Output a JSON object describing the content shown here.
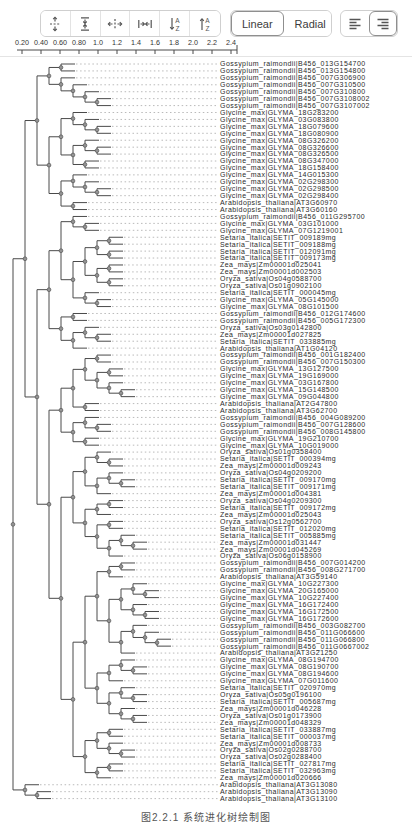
{
  "toolbar": {
    "icon_buttons": [
      {
        "icon": "expand-vertical-icon"
      },
      {
        "icon": "compress-vertical-icon"
      },
      {
        "icon": "expand-horizontal-icon"
      },
      {
        "icon": "compress-horizontal-icon"
      },
      {
        "icon": "sort-descending-icon"
      },
      {
        "icon": "sort-ascending-icon"
      }
    ],
    "layout_buttons": [
      {
        "label": "Linear",
        "selected": true
      },
      {
        "label": "Radial",
        "selected": false
      }
    ],
    "align_buttons": [
      {
        "icon": "align-left-icon",
        "selected": false
      },
      {
        "icon": "align-right-icon",
        "selected": true
      }
    ]
  },
  "scale_bar": {
    "ticks": [
      "0.20",
      "0.40",
      "0.60",
      "0.80",
      "1.0",
      "1.2",
      "1.4",
      "1.6",
      "1.8",
      "2.0",
      "2.2",
      "2.4"
    ]
  },
  "caption": {
    "text": "图2.2.1 系统进化树绘制图"
  },
  "colors": {
    "branch": "#4a4a4a",
    "leader": "#a8a8a8",
    "node_fill": "#949494",
    "node_stroke": "#4a4a4a",
    "label": "#2b2b2b",
    "tick_label": "#333333"
  },
  "tree": {
    "leaves": [
      "Gossypium_raimondii|B456_013G154700",
      "Gossypium_raimondii|B456_013G154800",
      "Gossypium_raimondii|B456_007G306900",
      "Gossypium_raimondii|B456_007G310500",
      "Gossypium_raimondii|B456_007G310800",
      "Gossypium_raimondii|B456_007G3108002",
      "Gossypium_raimondii|B456_007G3107002",
      "Glycine_max|GLYMA_18G283200",
      "Glycine_max|GLYMA_03G083800",
      "Glycine_max|GLYMA_18G079600",
      "Glycine_max|GLYMA_18G080900",
      "Glycine_max|GLYMA_08G326200",
      "Glycine_max|GLYMA_08G326600",
      "Glycine_max|GLYMA_08G326500",
      "Glycine_max|GLYMA_08G347000",
      "Glycine_max|GLYMA_18G158400",
      "Glycine_max|GLYMA_14G015300",
      "Glycine_max|GLYMA_02G298300",
      "Glycine_max|GLYMA_02G298500",
      "Glycine_max|GLYMA_02G298400",
      "Arabidopsis_thaliana|AT3G60970",
      "Arabidopsis_thaliana|AT3G60160",
      "Gossypium_raimondii|B456_011G295700",
      "Glycine_max|GLYMA_03G101000",
      "Glycine_max|GLYMA_07G1219001",
      "Setaria_italica|SETIT_009189mg",
      "Setaria_italica|SETIT_009188mg",
      "Setaria_italica|SETIT_012091mg",
      "Setaria_italica|SETIT_009173mg",
      "Zea_mays|Zm00001d025041",
      "Zea_mays|Zm00001d002503",
      "Oryza_sativa|Os04g0588700",
      "Oryza_sativa|Os01g0902100",
      "Setaria_italica|SETIT_000045mg",
      "Glycine_max|GLYMA_05G145000",
      "Glycine_max|GLYMA_08G101500",
      "Gossypium_raimondii|B456_012G174600",
      "Gossypium_raimondii|B456_005G172300",
      "Oryza_sativa|Os03g0142800",
      "Zea_mays|Zm00001d027825",
      "Setaria_italica|SETIT_033885mg",
      "Arabidopsis_thaliana|AT1G04120",
      "Gossypium_raimondii|B456_001G182400",
      "Gossypium_raimondii|B456_007G150300",
      "Glycine_max|GLYMA_13G127500",
      "Glycine_max|GLYMA_19G169000",
      "Glycine_max|GLYMA_03G167800",
      "Glycine_max|GLYMA_15G148500",
      "Glycine_max|GLYMA_09G044800",
      "Arabidopsis_thaliana|AT2G47800",
      "Arabidopsis_thaliana|AT3G62700",
      "Gossypium_raimondii|B456_004G089200",
      "Gossypium_raimondii|B456_007G128600",
      "Gossypium_raimondii|B456_008G145800",
      "Glycine_max|GLYMA_19G210700",
      "Glycine_max|GLYMA_10G019000",
      "Oryza_sativa|Os01g0358400",
      "Setaria_italica|SETIT_000394mg",
      "Zea_mays|Zm00001d009243",
      "Oryza_sativa|Os04g0209200",
      "Setaria_italica|SETIT_009170mg",
      "Setaria_italica|SETIT_009171mg",
      "Zea_mays|Zm00001d004381",
      "Oryza_sativa|Os04g0209300",
      "Setaria_italica|SETIT_009172mg",
      "Zea_mays|Zm00001d025043",
      "Oryza_sativa|Os12g0562700",
      "Setaria_italica|SETIT_012020mg",
      "Setaria_italica|SETIT_005885mg",
      "Zea_mays|Zm00001d031447",
      "Zea_mays|Zm00001d045269",
      "Oryza_sativa|Os06g0158900",
      "Gossypium_raimondii|B456_007G014200",
      "Gossypium_raimondii|B456_008G271700",
      "Arabidopsis_thaliana|AT3G59140",
      "Glycine_max|GLYMA_10G227300",
      "Glycine_max|GLYMA_20G165000",
      "Glycine_max|GLYMA_10G227400",
      "Glycine_max|GLYMA_16G172400",
      "Glycine_max|GLYMA_16G172500",
      "Glycine_max|GLYMA_16G172600",
      "Gossypium_raimondii|B456_003G082700",
      "Gossypium_raimondii|B456_011G066600",
      "Gossypium_raimondii|B456_011G066800",
      "Gossypium_raimondii|B456_011G0667002",
      "Arabidopsis_thaliana|AT3G21250",
      "Glycine_max|GLYMA_08G194700",
      "Glycine_max|GLYMA_08G190700",
      "Glycine_max|GLYMA_08G194600",
      "Glycine_max|GLYMA_07G011600",
      "Setaria_italica|SETIT_020970mg",
      "Oryza_sativa|Os05g0196100",
      "Setaria_italica|SETIT_005687mg",
      "Zea_mays|Zm00001d046228",
      "Oryza_sativa|Os01g0173900",
      "Zea_mays|Zm00001d048329",
      "Setaria_italica|SETIT_033887mg",
      "Setaria_italica|SETIT_000037mg",
      "Zea_mays|Zm00001d008733",
      "Oryza_sativa|Os02g0288700",
      "Oryza_sativa|Os02g0288400",
      "Setaria_italica|SETIT_027817mg",
      "Setaria_italica|SETIT_032963mg",
      "Zea_mays|Zm00001d020666",
      "Arabidopsis_thaliana|AT3G13080",
      "Arabidopsis_thaliana|AT3G13090",
      "Arabidopsis_thaliana|AT3G13100"
    ],
    "topology": [
      [
        [
          [
            [
              0,
              1
            ],
            [
              2,
              [
                3,
                [
                  4,
                  [
                    5,
                    6
                  ]
                ]
              ]
            ]
          ],
          [
            [
              [
                7,
                [
                  8,
                  [
                    9,
                    10
                  ]
                ]
              ],
              [
                [
                  11,
                  [
                    12,
                    13
                  ]
                ],
                [
                  14,
                  15
                ]
              ]
            ],
            [
              [
                16,
                [
                  17,
                  [
                    18,
                    19
                  ]
                ]
              ],
              [
                20,
                21
              ]
            ]
          ]
        ],
        [
          [
            [
              [
                22,
                [
                  23,
                  24
                ]
              ],
              [
                [
                  [
                    [
                      25,
                      26
                    ],
                    [
                      27,
                      28
                    ]
                  ],
                  [
                    [
                      29,
                      30
                    ],
                    [
                      31,
                      32
                    ]
                  ]
                ],
                [
                  33,
                  [
                    34,
                    35
                  ]
                ]
              ]
            ],
            [
              [
                36,
                37
              ],
              [
                [
                  38,
                  [
                    39,
                    40
                  ]
                ],
                41
              ]
            ]
          ],
          [
            [
              [
                [
                  [
                    42,
                    43
                  ],
                  [
                    [
                      44,
                      45
                    ],
                    [
                      46,
                      [
                        47,
                        48
                      ]
                    ]
                  ]
                ],
                [
                  49,
                  50
                ]
              ],
              [
                [
                  51,
                  [
                    52,
                    53
                  ]
                ],
                [
                  54,
                  55
                ]
              ]
            ],
            [
              [
                [
                  [
                    56,
                    [
                      57,
                      58
                    ]
                  ],
                  [
                    [
                      59,
                      [
                        60,
                        61
                      ]
                    ],
                    62
                  ]
                ],
                [
                  [
                    [
                      63,
                      64
                    ],
                    65
                  ],
                  [
                    [
                      66,
                      67
                    ],
                    [
                      [
                        68,
                        [
                          69,
                          70
                        ]
                      ],
                      71
                    ]
                  ]
                ]
              ],
              [
                [
                  [
                    [
                      [
                        72,
                        73
                      ],
                      74
                    ],
                    [
                      [
                        [
                          75,
                          [
                            76,
                            77
                          ]
                        ],
                        [
                          78,
                          [
                            79,
                            80
                          ]
                        ]
                      ],
                      [
                        [
                          81,
                          [
                            82,
                            [
                              83,
                              84
                            ]
                          ]
                        ],
                        85
                      ]
                    ]
                  ],
                  [
                    [
                      [
                        86,
                        [
                          87,
                          88
                        ]
                      ],
                      89
                    ],
                    [
                      [
                        90,
                        [
                          91,
                          92
                        ]
                      ],
                      [
                        93,
                        [
                          94,
                          95
                        ]
                      ]
                    ]
                  ]
                ],
                [
                  [
                    [
                      96,
                      97
                    ],
                    [
                      98,
                      [
                        99,
                        100
                      ]
                    ]
                  ],
                  [
                    [
                      101,
                      102
                    ],
                    103
                  ]
                ]
              ]
            ]
          ]
        ]
      ],
      [
        104,
        [
          105,
          106
        ]
      ]
    ]
  }
}
